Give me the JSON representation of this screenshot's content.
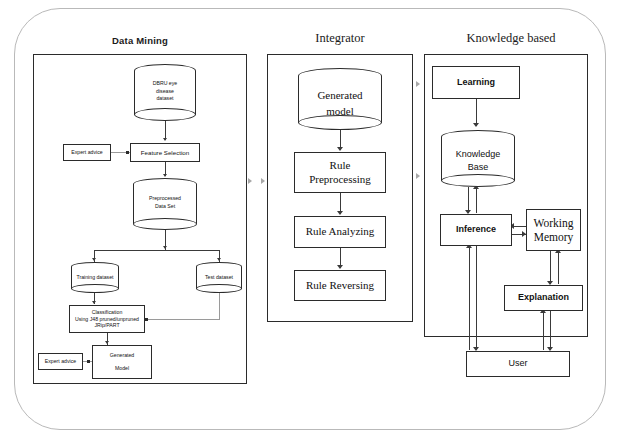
{
  "diagram": {
    "columns": [
      {
        "id": "data-mining",
        "header": "Data Mining",
        "nodes": {
          "source_dataset": "DBRU eye\ndisease\ndataset",
          "expert_advice_top": "Expert advice",
          "feature_selection": "Feature Selection",
          "preprocessed": "Preprocessed\nData Set",
          "training_dataset": "Training dataset",
          "test_dataset": "Test dataset",
          "classification": "Classification\nUsing J48 pruned/unpruned\nJRip/PART",
          "expert_advice_bottom": "Expert advice",
          "generated_model": "Generated\n\nModel"
        }
      },
      {
        "id": "integrator",
        "header": "Integrator",
        "nodes": {
          "generated_model": "Generated\nmodel",
          "rule_preprocessing": "Rule\nPreprocessing",
          "rule_analyzing": "Rule Analyzing",
          "rule_reversing": "Rule Reversing"
        }
      },
      {
        "id": "knowledge-based",
        "header": "Knowledge based",
        "nodes": {
          "learning": "Learning",
          "knowledge_base": "Knowledge\nBase",
          "inference": "Inference",
          "working_memory": "Working\nMemory",
          "explanation": "Explanation",
          "user": "User"
        }
      }
    ],
    "colors": {
      "stroke": "#2b2b2b",
      "connector": "#3a3a3a",
      "faint_connector": "#a8a8a8",
      "frame": "#b9b9b9",
      "background": "#ffffff",
      "text": "#111111"
    }
  }
}
